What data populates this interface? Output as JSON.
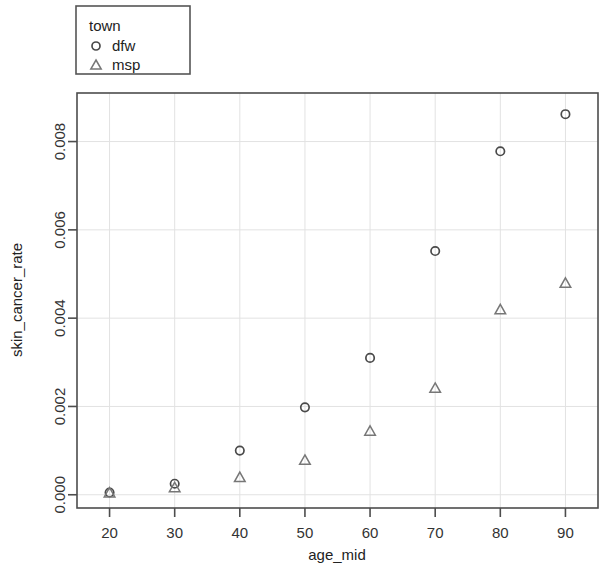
{
  "chart_data": {
    "type": "scatter",
    "title": "",
    "xlabel": "age_mid",
    "ylabel": "skin_cancer_rate",
    "xlim": [
      15,
      95
    ],
    "ylim": [
      -0.0003,
      0.0091
    ],
    "xticks": [
      20,
      30,
      40,
      50,
      60,
      70,
      80,
      90
    ],
    "xtick_labels": [
      "20",
      "30",
      "40",
      "50",
      "60",
      "70",
      "80",
      "90"
    ],
    "yticks": [
      0.0,
      0.002,
      0.004,
      0.006,
      0.008
    ],
    "ytick_labels": [
      "0.000",
      "0.002",
      "0.004",
      "0.006",
      "0.008"
    ],
    "grid": true,
    "grid_color": "#e2e2e2",
    "legend": {
      "title": "town",
      "position": "top-left-outside",
      "entries": [
        {
          "label": "dfw",
          "marker": "circle"
        },
        {
          "label": "msp",
          "marker": "triangle"
        }
      ]
    },
    "x": [
      20,
      30,
      40,
      50,
      60,
      70,
      80,
      90
    ],
    "series": [
      {
        "name": "dfw",
        "marker": "circle",
        "color": "#4a4a4a",
        "values": [
          5e-05,
          0.00025,
          0.001,
          0.00198,
          0.0031,
          0.00552,
          0.00778,
          0.00862
        ]
      },
      {
        "name": "msp",
        "marker": "triangle",
        "color": "#777777",
        "values": [
          3e-05,
          0.00015,
          0.00038,
          0.00077,
          0.00143,
          0.0024,
          0.00418,
          0.00478
        ]
      }
    ]
  }
}
